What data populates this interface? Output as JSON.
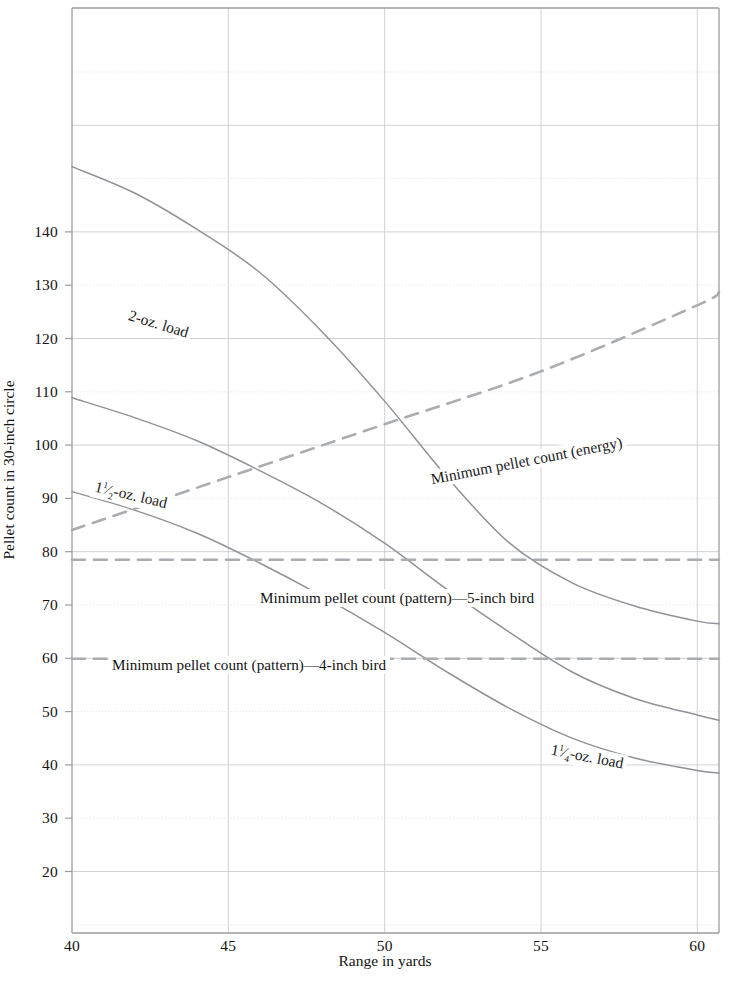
{
  "chart_data": {
    "type": "line",
    "title": "",
    "xlabel": "Range in yards",
    "ylabel": "Pellet count in 30-inch circle",
    "xlim": [
      40,
      60.7
    ],
    "ylim": [
      14,
      154
    ],
    "grid": true,
    "legend": "inline-curve-labels",
    "xticks": [
      40,
      45,
      50,
      55,
      60
    ],
    "yticks": [
      20,
      30,
      40,
      50,
      60,
      70,
      80,
      90,
      100,
      110,
      120,
      130,
      140
    ],
    "series": [
      {
        "name": "2-oz. load",
        "style": "solid",
        "label": "2-oz. load",
        "x": [
          40,
          42,
          44,
          46,
          48,
          50,
          52,
          54,
          56,
          58,
          60,
          60.7
        ],
        "y": [
          130,
          126,
          120.5,
          114,
          105,
          94.5,
          83,
          73,
          67,
          63.5,
          61.2,
          60.8
        ]
      },
      {
        "name": "1.5-oz. load",
        "style": "solid",
        "label": "1½-oz. load",
        "x": [
          40,
          42,
          44,
          46,
          48,
          50,
          52,
          54,
          56,
          58,
          60,
          60.7
        ],
        "y": [
          95,
          92,
          88.5,
          84,
          79,
          73,
          66,
          59.5,
          53.5,
          49.5,
          47,
          46.2
        ]
      },
      {
        "name": "1.25-oz. load",
        "style": "solid",
        "label": "1¼-oz. load",
        "x": [
          40,
          42,
          44,
          46,
          48,
          50,
          52,
          54,
          56,
          58,
          60,
          60.7
        ],
        "y": [
          80.8,
          78,
          74.5,
          70,
          65,
          59.5,
          53.5,
          48,
          43.5,
          40.5,
          38.6,
          38.2
        ]
      },
      {
        "name": "Minimum pellet count (energy)",
        "style": "dashed",
        "label": "Minimum pellet count (energy)",
        "x": [
          40,
          45,
          50,
          55,
          60,
          60.7
        ],
        "y": [
          75,
          83,
          91,
          99,
          109,
          111
        ]
      },
      {
        "name": "Minimum pellet count (pattern)—5-inch bird",
        "style": "dashed",
        "label": "Minimum pellet count (pattern)—5-inch bird",
        "x": [
          40,
          60.7
        ],
        "y": [
          70.5,
          70.5
        ]
      },
      {
        "name": "Minimum pellet count (pattern)—4-inch bird",
        "style": "dashed",
        "label": "Minimum pellet count (pattern)—4-inch bird",
        "x": [
          40,
          60.7
        ],
        "y": [
          55.5,
          55.5
        ]
      }
    ]
  },
  "axes": {
    "xlabel": "Range in yards",
    "ylabel": "Pellet count in 30-inch circle",
    "xticks": [
      "40",
      "45",
      "50",
      "55",
      "60"
    ],
    "yticks": [
      "140",
      "130",
      "120",
      "110",
      "100",
      "90",
      "80",
      "70",
      "60",
      "50",
      "40",
      "30",
      "20"
    ]
  },
  "labels": {
    "two_oz": "2-oz. load",
    "one_half_oz_num": "1",
    "one_half_oz_frac_top": "1",
    "one_half_oz_frac_bot": "2",
    "one_half_oz_tail": "-oz. load",
    "one_quarter_oz_num": "1",
    "one_quarter_oz_frac_top": "1",
    "one_quarter_oz_frac_bot": "4",
    "one_quarter_oz_tail": "-oz. load",
    "energy": "Minimum pellet count (energy)",
    "pattern5": "Minimum pellet count (pattern)—5-inch bird",
    "pattern4": "Minimum pellet count (pattern)—4-inch bird"
  },
  "colors": {
    "curve": "#8f9296",
    "dashed": "#a9acb0",
    "grid": "#c9ccd0",
    "grid_dotted": "#d6d9dc",
    "axis": "#9a9da1",
    "text": "#141414",
    "background": "#ffffff"
  }
}
